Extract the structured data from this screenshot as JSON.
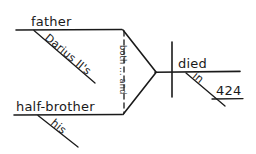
{
  "diagram": {
    "type": "reed-kellogg-sentence-diagram",
    "ink_color": "#1a1a1a",
    "background_color": "#ffffff",
    "labels": {
      "subject_one": "father",
      "subject_one_modifier": "Darius II's",
      "subject_two": "half-brother",
      "subject_two_modifier": "his",
      "conjunction": "both ... and",
      "verb": "died",
      "preposition": "in",
      "object_of_preposition": "424"
    }
  }
}
